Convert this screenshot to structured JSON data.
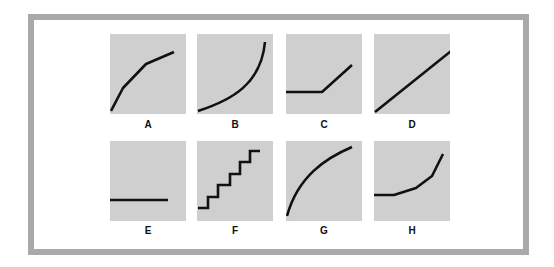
{
  "figure": {
    "panels": [
      {
        "label": "A",
        "shape": "concave-down piecewise rising curve"
      },
      {
        "label": "B",
        "shape": "convex rising curve (accelerating)"
      },
      {
        "label": "C",
        "shape": "flat then rising line"
      },
      {
        "label": "D",
        "shape": "straight rising line"
      },
      {
        "label": "E",
        "shape": "flat horizontal line"
      },
      {
        "label": "F",
        "shape": "rising staircase"
      },
      {
        "label": "G",
        "shape": "concave-down rising curve (decelerating)"
      },
      {
        "label": "H",
        "shape": "flat then sharply rising piecewise curve"
      }
    ]
  },
  "colors": {
    "frame_border": "#a9a9a9",
    "panel_bg": "#cfcfcf",
    "line": "#111111"
  }
}
